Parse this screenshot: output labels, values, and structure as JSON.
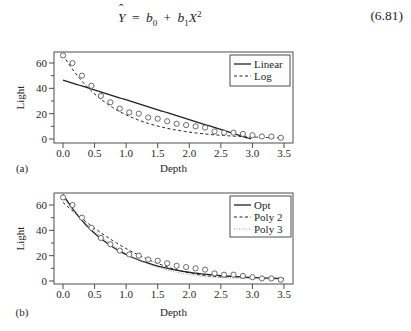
{
  "equation": {
    "lhs": "Y",
    "equals": "=",
    "b0": "b",
    "b0_sub": "0",
    "plus": "+",
    "b1": "b",
    "b1_sub": "1",
    "x": "X",
    "x_sup": "2",
    "number": "(6.81)"
  },
  "chart_data": [
    {
      "panel": "(a)",
      "type": "scatter",
      "title": "",
      "xlabel": "Depth",
      "ylabel": "Light",
      "xlim": [
        -0.1,
        3.6
      ],
      "ylim": [
        -3,
        69
      ],
      "xticks": [
        0.0,
        0.5,
        1.0,
        1.5,
        2.0,
        2.5,
        3.0,
        3.5
      ],
      "xtick_labels": [
        "0.0",
        "0.5",
        "1.0",
        "1.5",
        "2.0",
        "2.5",
        "3.0",
        "3.5"
      ],
      "yticks": [
        0,
        20,
        40,
        60
      ],
      "ytick_labels": [
        "0",
        "20",
        "40",
        "60"
      ],
      "minor_yticks": [
        10,
        30,
        50
      ],
      "grid": false,
      "legend_position": "top-right",
      "points": {
        "x": [
          0.0,
          0.15,
          0.3,
          0.45,
          0.6,
          0.75,
          0.9,
          1.05,
          1.2,
          1.35,
          1.5,
          1.65,
          1.8,
          1.95,
          2.1,
          2.25,
          2.4,
          2.55,
          2.7,
          2.85,
          3.0,
          3.15,
          3.3,
          3.45
        ],
        "y": [
          66,
          60,
          50,
          42,
          34,
          29,
          24,
          21,
          20,
          17,
          16,
          14,
          12,
          11,
          10,
          9,
          6,
          5,
          5,
          4,
          3,
          2,
          2,
          1
        ]
      },
      "series": [
        {
          "name": "Linear",
          "style": "solid",
          "color": "#231f20",
          "model": "linear",
          "params": {
            "a": 46.5,
            "b": -15.6
          },
          "x_range": [
            0.0,
            2.98
          ]
        },
        {
          "name": "Log",
          "style": "dashed",
          "color": "#231f20",
          "model": "exp",
          "params": {
            "a": 66.5,
            "k": 1.25
          },
          "x_range": [
            0.0,
            3.5
          ]
        }
      ]
    },
    {
      "panel": "(b)",
      "type": "scatter",
      "title": "",
      "xlabel": "Depth",
      "ylabel": "Light",
      "xlim": [
        -0.1,
        3.6
      ],
      "ylim": [
        -3,
        69
      ],
      "xticks": [
        0.0,
        0.5,
        1.0,
        1.5,
        2.0,
        2.5,
        3.0,
        3.5
      ],
      "xtick_labels": [
        "0.0",
        "0.5",
        "1.0",
        "1.5",
        "2.0",
        "2.5",
        "3.0",
        "3.5"
      ],
      "yticks": [
        0,
        20,
        40,
        60
      ],
      "ytick_labels": [
        "0",
        "20",
        "40",
        "60"
      ],
      "minor_yticks": [
        10,
        30,
        50
      ],
      "grid": false,
      "legend_position": "top-right",
      "points": {
        "x": [
          0.0,
          0.15,
          0.3,
          0.45,
          0.6,
          0.75,
          0.9,
          1.05,
          1.2,
          1.35,
          1.5,
          1.65,
          1.8,
          1.95,
          2.1,
          2.25,
          2.4,
          2.55,
          2.7,
          2.85,
          3.0,
          3.15,
          3.3,
          3.45
        ],
        "y": [
          66,
          60,
          50,
          42,
          34,
          29,
          24,
          21,
          20,
          17,
          16,
          14,
          12,
          11,
          10,
          9,
          6,
          5,
          5,
          4,
          3,
          2,
          2,
          1
        ]
      },
      "series": [
        {
          "name": "Opt",
          "style": "solid",
          "color": "#231f20",
          "model": "exp_offset",
          "params": {
            "a": 67.5,
            "k": 1.22,
            "c": 1.0
          },
          "x_range": [
            0.0,
            3.5
          ]
        },
        {
          "name": "Poly 2",
          "style": "dashed",
          "color": "#231f20",
          "model": "poly",
          "params": {
            "coef": [
              62.0,
              -45.0,
              8.6
            ]
          },
          "x_range": [
            0.0,
            2.6
          ],
          "note": "quadratic fit; tail continues near data"
        },
        {
          "name": "Poly 3",
          "style": "dotted",
          "color": "#9a9a9a",
          "model": "poly",
          "params": {
            "coef": [
              65.5,
              -62.0,
              20.5,
              -2.3
            ]
          },
          "x_range": [
            0.0,
            3.5
          ]
        }
      ]
    }
  ],
  "panels": {
    "a": {
      "label": "(a)",
      "xlabel": "Depth",
      "ylabel": "Light",
      "legend": [
        "Linear",
        "Log"
      ]
    },
    "b": {
      "label": "(b)",
      "xlabel": "Depth",
      "ylabel": "Light",
      "legend": [
        "Opt",
        "Poly 2",
        "Poly 3"
      ]
    }
  },
  "colors": {
    "ink": "#231f20",
    "axis": "#4d4d4f",
    "marker": "#58595b",
    "poly3": "#9a9a9a",
    "background": "#ffffff"
  }
}
